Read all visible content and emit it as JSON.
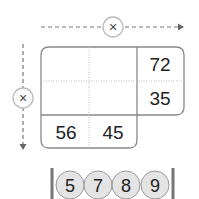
{
  "diagram": {
    "type": "multiplication-grid",
    "top_operator": {
      "symbol": "×"
    },
    "left_operator": {
      "symbol": "×"
    },
    "grid": {
      "rows": [
        [
          "",
          "",
          "72"
        ],
        [
          "",
          "",
          "35"
        ],
        [
          "56",
          "45",
          ""
        ]
      ]
    },
    "balls": [
      "5",
      "7",
      "8",
      "9"
    ]
  }
}
